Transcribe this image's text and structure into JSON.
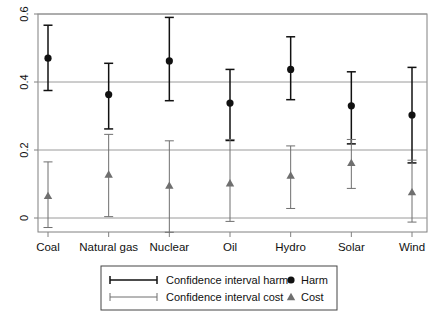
{
  "chart_data": {
    "type": "scatter",
    "title": "",
    "subtitle": "",
    "xlabel": "",
    "ylabel": "",
    "categories": [
      "Coal",
      "Natural gas",
      "Nuclear",
      "Oil",
      "Hydro",
      "Solar",
      "Wind"
    ],
    "ylim": [
      -0.06,
      0.6
    ],
    "yticks": [
      0,
      0.2,
      0.4,
      0.6
    ],
    "ytick_labels": [
      "0",
      "0.2",
      "0.4",
      "0.6"
    ],
    "grid": "horizontal",
    "legend_position": "bottom-center",
    "axis_color": "#808080",
    "grid_color": "#9a9a9a",
    "series": [
      {
        "name": "Harm",
        "marker": "circle",
        "color": "#111111",
        "values": [
          0.47,
          0.363,
          0.462,
          0.338,
          0.437,
          0.33,
          0.303
        ],
        "ci_low": [
          0.375,
          0.262,
          0.345,
          0.228,
          0.348,
          0.218,
          0.162
        ],
        "ci_high": [
          0.567,
          0.455,
          0.59,
          0.437,
          0.533,
          0.43,
          0.443
        ],
        "ci_name": "Confidence interval harm"
      },
      {
        "name": "Cost",
        "marker": "triangle",
        "color": "#6f6f6f",
        "values": [
          0.065,
          0.128,
          0.095,
          0.102,
          0.125,
          0.162,
          0.076
        ],
        "ci_low": [
          -0.028,
          0.004,
          -0.042,
          -0.01,
          0.028,
          0.087,
          -0.012
        ],
        "ci_high": [
          0.165,
          0.246,
          0.227,
          0.231,
          0.212,
          0.231,
          0.17
        ],
        "ci_name": "Confidence interval cost"
      }
    ]
  },
  "legend": {
    "entries": [
      {
        "label": "Confidence interval harm",
        "symbol": "ci-bar-dark"
      },
      {
        "label": "Confidence interval cost",
        "symbol": "ci-bar-light"
      }
    ],
    "markers": [
      {
        "label": "Harm",
        "symbol": "filled-circle"
      },
      {
        "label": "Cost",
        "symbol": "filled-triangle"
      }
    ]
  }
}
